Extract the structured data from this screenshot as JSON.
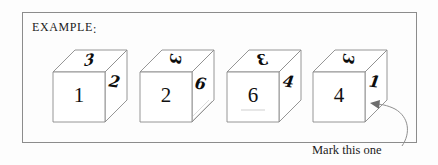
{
  "page": {
    "background_color": "#fdfdfd",
    "width": 438,
    "height": 165
  },
  "panel": {
    "border_color": "#8c8c8c",
    "label": "EXAMPLE",
    "label_punctuation": ":"
  },
  "cubes": [
    {
      "index": 1,
      "front_digit": "1",
      "top_digit": "3",
      "side_digit": "2",
      "has_underline": false
    },
    {
      "index": 2,
      "front_digit": "2",
      "top_digit": "3",
      "side_digit": "6",
      "has_underline": false
    },
    {
      "index": 3,
      "front_digit": "6",
      "top_digit": "3",
      "side_digit": "4",
      "has_underline": true
    },
    {
      "index": 4,
      "front_digit": "4",
      "top_digit": "3",
      "side_digit": "1",
      "has_underline": false
    }
  ],
  "annotation": {
    "caption": "Mark this one",
    "target_cube_index": 4,
    "arrow_color": "#8f8f8f"
  }
}
